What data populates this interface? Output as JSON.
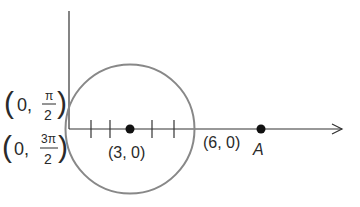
{
  "diagram": {
    "type": "polar-coordinate-circle",
    "axes": {
      "has_vertical_axis": true,
      "has_horizontal_arrow": true
    },
    "circle": {
      "center_label": "(3, 0)",
      "right_intersection_label": "(6, 0)"
    },
    "points": [
      {
        "name": "center",
        "label": "(3, 0)"
      },
      {
        "name": "A",
        "label": "A"
      }
    ],
    "left_labels": {
      "upper": {
        "open": "(",
        "coord": "0,",
        "num": "π",
        "den": "2",
        "close": ")"
      },
      "lower": {
        "open": "(",
        "coord": "0,",
        "num": "3π",
        "den": "2",
        "close": ")"
      }
    },
    "tick_count": 4,
    "colors": {
      "axis": "#333333",
      "circle": "#888888",
      "point": "#111111",
      "text": "#2a2a2a"
    }
  }
}
